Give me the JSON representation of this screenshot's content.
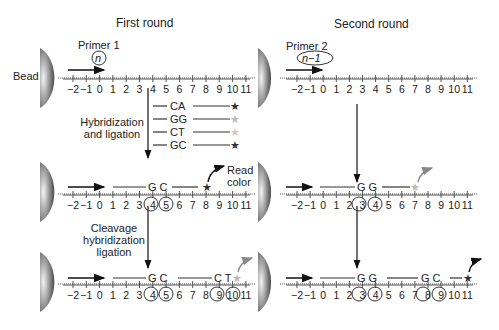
{
  "headers": {
    "first_round": "First round",
    "second_round": "Second round"
  },
  "labels": {
    "bead": "Bead",
    "primer1": "Primer 1",
    "primer1_tag": "n",
    "primer2": "Primer 2",
    "primer2_tag": "n−1",
    "hybridization_line1": "Hybridization",
    "hybridization_line2": "and ligation",
    "cleavage_line1": "Cleavage",
    "cleavage_line2": "hybridization",
    "cleavage_line3": "ligation",
    "read_line1": "Read",
    "read_line2": "color"
  },
  "ruler_ticks": [
    "−2",
    "−1",
    "0",
    "1",
    "2",
    "3",
    "4",
    "5",
    "6",
    "7",
    "8",
    "9",
    "10",
    "11"
  ],
  "probes": [
    {
      "seq": "CA",
      "star_color": "#333333"
    },
    {
      "seq": "GG",
      "star_color": "#bbbbbb"
    },
    {
      "seq": "CT",
      "star_color": "#cccccc"
    },
    {
      "seq": "GC",
      "star_color": "#333333"
    }
  ],
  "first_round": {
    "step2": {
      "seq": "G C",
      "circled": [
        "4",
        "5"
      ]
    },
    "step3": {
      "seq1": "G C",
      "seq2": "C T",
      "circled": [
        "4",
        "5",
        "9",
        "10"
      ]
    }
  },
  "second_round": {
    "step2": {
      "seq": "G G",
      "circled": [
        "3",
        "4"
      ]
    },
    "step3": {
      "seq1": "G G",
      "seq2": "G C",
      "circled": [
        "3",
        "4",
        "8",
        "9"
      ]
    }
  }
}
